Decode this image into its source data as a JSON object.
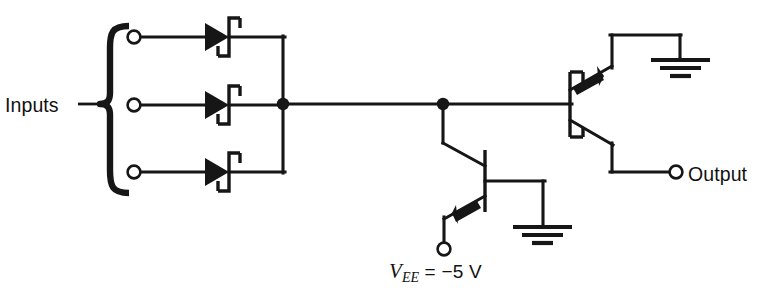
{
  "figure": {
    "kind": "circuit-schematic",
    "background_color": "#ffffff",
    "line_color": "#161616"
  },
  "labels": {
    "inputs": "Inputs",
    "output": "Output",
    "supply_symbol": "V",
    "supply_subscript": "EE",
    "supply_equals": " = ",
    "supply_value": "−5 V",
    "supply_full": "VEE = −5 V"
  },
  "components": {
    "input_terminals": [
      {
        "name": "input-terminal-1",
        "x": 132,
        "y": 37
      },
      {
        "name": "input-terminal-2",
        "x": 132,
        "y": 105
      },
      {
        "name": "input-terminal-3",
        "x": 132,
        "y": 172
      }
    ],
    "diodes": [
      {
        "name": "schottky-diode-1",
        "type": "schottky",
        "x": 214,
        "y": 37
      },
      {
        "name": "schottky-diode-2",
        "type": "schottky",
        "x": 214,
        "y": 105
      },
      {
        "name": "schottky-diode-3",
        "type": "schottky",
        "x": 214,
        "y": 172
      }
    ],
    "transistors": [
      {
        "name": "transistor-q1",
        "type": "pnp-schottky-clamped",
        "base_x": 485,
        "base_y": 180
      },
      {
        "name": "transistor-q2",
        "type": "pnp-schottky-clamped",
        "base_x": 570,
        "base_y": 104
      }
    ],
    "junctions": [
      {
        "name": "junction-node-a",
        "x": 283,
        "y": 104
      },
      {
        "name": "junction-node-b",
        "x": 443,
        "y": 104
      }
    ],
    "grounds": [
      {
        "name": "ground-symbol-top-right",
        "x": 680,
        "y": 60
      },
      {
        "name": "ground-symbol-bottom",
        "x": 529,
        "y": 227
      }
    ],
    "terminals": [
      {
        "name": "output-terminal",
        "x": 676,
        "y": 172
      },
      {
        "name": "vee-terminal",
        "x": 444,
        "y": 249
      }
    ],
    "brace": {
      "name": "inputs-brace",
      "x": 104,
      "y_top": 25,
      "y_bottom": 195
    }
  }
}
